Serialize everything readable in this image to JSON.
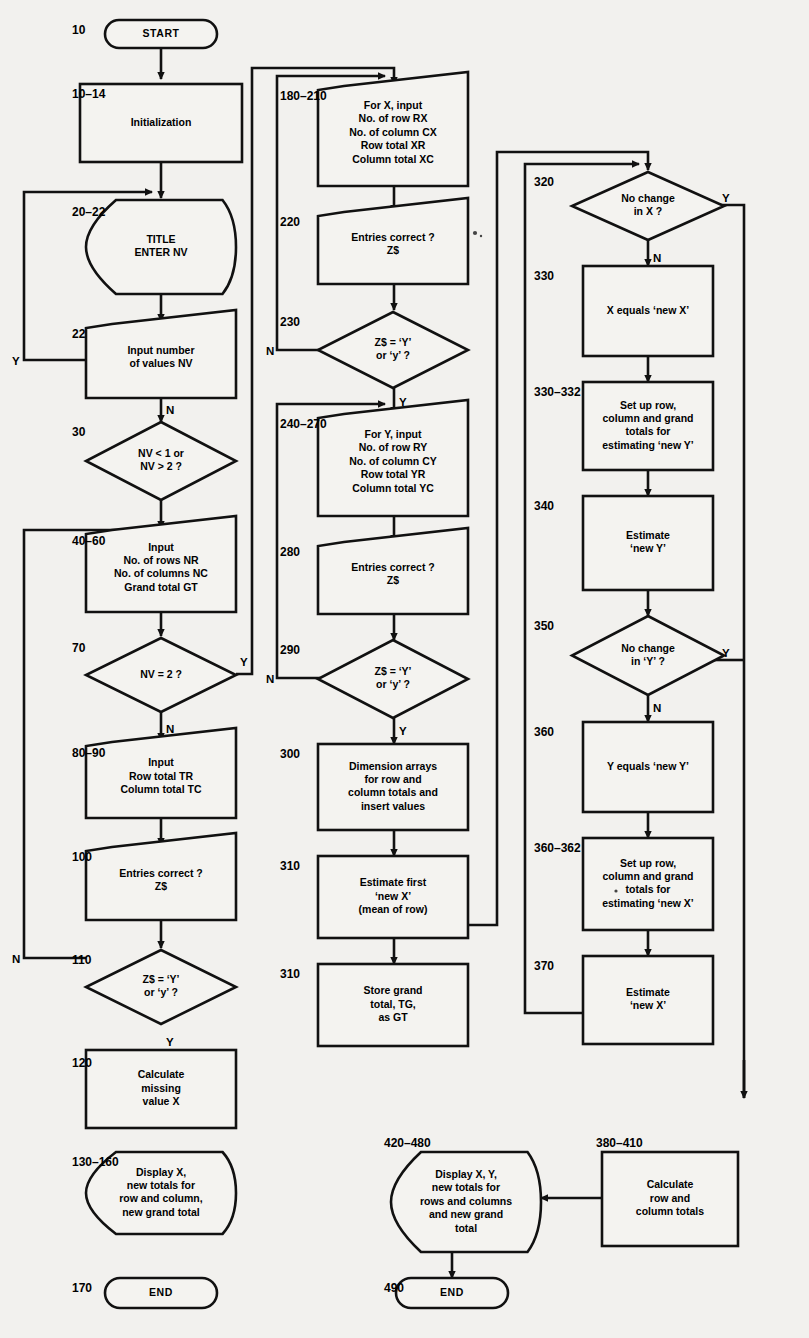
{
  "diagram": {
    "colors": {
      "ink": "#111111",
      "paper": "#f2f1ee",
      "shape_fill": "#f4f3f0"
    },
    "branch_labels": {
      "yes": "Y",
      "no": "N"
    },
    "nodes": [
      {
        "id": "n10",
        "line": "10",
        "shape": "terminator",
        "text": [
          "START"
        ]
      },
      {
        "id": "n1014",
        "line": "10–14",
        "shape": "process",
        "text": [
          "Initialization"
        ]
      },
      {
        "id": "n2022",
        "line": "20–22",
        "shape": "display",
        "text": [
          "TITLE",
          "ENTER NV"
        ]
      },
      {
        "id": "n22",
        "line": "22",
        "shape": "input",
        "text": [
          "Input number",
          "of values NV"
        ]
      },
      {
        "id": "n30",
        "line": "30",
        "shape": "decision",
        "text": [
          "NV < 1 or",
          "NV > 2 ?"
        ]
      },
      {
        "id": "n4060",
        "line": "40–60",
        "shape": "input",
        "text": [
          "Input",
          "No. of rows NR",
          "No. of columns NC",
          "Grand total GT"
        ]
      },
      {
        "id": "n70",
        "line": "70",
        "shape": "decision",
        "text": [
          "NV = 2 ?"
        ]
      },
      {
        "id": "n8090",
        "line": "80–90",
        "shape": "input",
        "text": [
          "Input",
          "Row total TR",
          "Column total TC"
        ]
      },
      {
        "id": "n100",
        "line": "100",
        "shape": "input",
        "text": [
          "Entries correct ?",
          "Z$"
        ]
      },
      {
        "id": "n110",
        "line": "110",
        "shape": "decision",
        "text": [
          "Z$ = ‘Y’",
          "or ‘y’ ?"
        ]
      },
      {
        "id": "n120",
        "line": "120",
        "shape": "process",
        "text": [
          "Calculate",
          "missing",
          "value X"
        ]
      },
      {
        "id": "n130160",
        "line": "130–160",
        "shape": "display",
        "text": [
          "Display X,",
          "new totals for",
          "row and column,",
          "new grand total"
        ]
      },
      {
        "id": "n170",
        "line": "170",
        "shape": "terminator",
        "text": [
          "END"
        ]
      },
      {
        "id": "n180210",
        "line": "180–210",
        "shape": "input",
        "text": [
          "For X, input",
          "No. of row RX",
          "No. of column CX",
          "Row total XR",
          "Column total XC"
        ]
      },
      {
        "id": "n220",
        "line": "220",
        "shape": "input",
        "text": [
          "Entries correct ?",
          "Z$"
        ]
      },
      {
        "id": "n230",
        "line": "230",
        "shape": "decision",
        "text": [
          "Z$ = ‘Y’",
          "or ‘y’ ?"
        ]
      },
      {
        "id": "n240270",
        "line": "240–270",
        "shape": "input",
        "text": [
          "For Y, input",
          "No. of row RY",
          "No. of column CY",
          "Row total YR",
          "Column total YC"
        ]
      },
      {
        "id": "n280",
        "line": "280",
        "shape": "input",
        "text": [
          "Entries correct ?",
          "Z$"
        ]
      },
      {
        "id": "n290",
        "line": "290",
        "shape": "decision",
        "text": [
          "Z$ = ‘Y’",
          "or ‘y’ ?"
        ]
      },
      {
        "id": "n300",
        "line": "300",
        "shape": "process",
        "text": [
          "Dimension arrays",
          "for row and",
          "column totals and",
          "insert values"
        ]
      },
      {
        "id": "n310a",
        "line": "310",
        "shape": "process",
        "text": [
          "Estimate first",
          "‘new X’",
          "(mean of row)"
        ]
      },
      {
        "id": "n310b",
        "line": "310",
        "shape": "process",
        "text": [
          "Store grand",
          "total, TG,",
          "as GT"
        ]
      },
      {
        "id": "n320",
        "line": "320",
        "shape": "decision",
        "text": [
          "No change",
          "in X ?"
        ]
      },
      {
        "id": "n330",
        "line": "330",
        "shape": "process",
        "text": [
          "X equals ‘new X’"
        ]
      },
      {
        "id": "n330332",
        "line": "330–332",
        "shape": "process",
        "text": [
          "Set up row,",
          "column and grand",
          "totals for",
          "estimating ‘new Y’"
        ]
      },
      {
        "id": "n340",
        "line": "340",
        "shape": "process",
        "text": [
          "Estimate",
          "‘new Y’"
        ]
      },
      {
        "id": "n350",
        "line": "350",
        "shape": "decision",
        "text": [
          "No change",
          "in ‘Y’ ?"
        ]
      },
      {
        "id": "n360",
        "line": "360",
        "shape": "process",
        "text": [
          "Y equals ‘new Y’"
        ]
      },
      {
        "id": "n360362",
        "line": "360–362",
        "shape": "process",
        "text": [
          "Set up row,",
          "column and grand",
          "totals for",
          "estimating ‘new X’"
        ]
      },
      {
        "id": "n370",
        "line": "370",
        "shape": "process",
        "text": [
          "Estimate",
          "‘new X’"
        ]
      },
      {
        "id": "n380410",
        "line": "380–410",
        "shape": "process",
        "text": [
          "Calculate",
          "row and",
          "column totals"
        ]
      },
      {
        "id": "n420480",
        "line": "420–480",
        "shape": "display",
        "text": [
          "Display X, Y,",
          "new totals for",
          "rows and columns",
          "and new grand",
          "total"
        ]
      },
      {
        "id": "n490",
        "line": "490",
        "shape": "terminator",
        "text": [
          "END"
        ]
      }
    ]
  }
}
